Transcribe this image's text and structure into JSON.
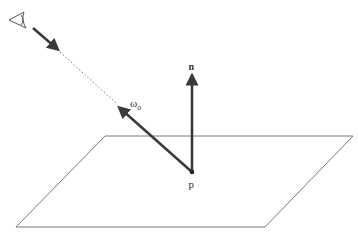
{
  "diagram": {
    "labels": {
      "normal": "n",
      "outgoing_direction": "ω",
      "outgoing_subscript": "o",
      "point": "p"
    },
    "elements": {
      "eye": "eye-icon",
      "plane": "surface-plane",
      "normal_vector": "normal-arrow",
      "outgoing_vector": "outgoing-arrow",
      "view_ray": "dotted-view-ray"
    },
    "colors": {
      "vector": "#3a3a3a",
      "plane": "#6a6a6a",
      "text": "#333333"
    }
  }
}
